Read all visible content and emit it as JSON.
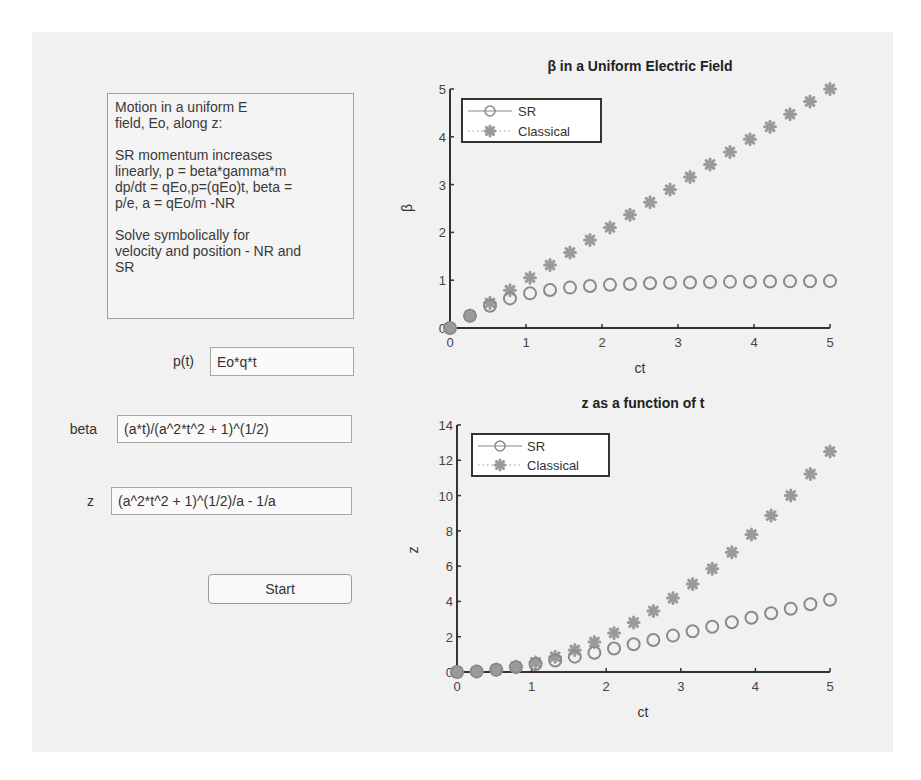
{
  "info_box": {
    "paragraphs": [
      "Motion in a uniform E\nfield, Eo, along z:",
      "SR momentum increases\nlinearly, p = beta*gamma*m\ndp/dt = qEo,p=(qEo)t, beta =\np/e,  a = qEo/m -NR",
      "Solve symbolically for\nvelocity and position - NR and\nSR"
    ]
  },
  "fields": {
    "p": {
      "label": "p(t)",
      "value": "Eo*q*t"
    },
    "beta": {
      "label": "beta",
      "value": "(a*t)/(a^2*t^2 + 1)^(1/2)"
    },
    "z": {
      "label": "z",
      "value": "(a^2*t^2 + 1)^(1/2)/a - 1/a"
    }
  },
  "start_button": {
    "label": "Start"
  },
  "colors": {
    "figure_bg": "#f1f1f1",
    "marker": "#8a8a8a",
    "axis": "#333333"
  },
  "chart_data": [
    {
      "type": "scatter",
      "title": "β in a Uniform Electric Field",
      "xlabel": "ct",
      "ylabel": "β",
      "xlim": [
        0,
        5
      ],
      "ylim": [
        0,
        5
      ],
      "xticks": [
        "0",
        "1",
        "2",
        "3",
        "4",
        "5"
      ],
      "yticks": [
        "0",
        "1",
        "2",
        "3",
        "4",
        "5"
      ],
      "grid": false,
      "legend_position": "upper left",
      "x": [
        0,
        0.263,
        0.526,
        0.789,
        1.053,
        1.316,
        1.579,
        1.842,
        2.105,
        2.368,
        2.632,
        2.895,
        3.158,
        3.421,
        3.684,
        3.947,
        4.211,
        4.474,
        4.737,
        5.0
      ],
      "series": [
        {
          "name": "SR",
          "marker": "open-circle",
          "line": "solid",
          "values": [
            0,
            0.254,
            0.466,
            0.619,
            0.725,
            0.796,
            0.845,
            0.879,
            0.903,
            0.921,
            0.935,
            0.945,
            0.953,
            0.96,
            0.965,
            0.969,
            0.973,
            0.976,
            0.978,
            0.981
          ]
        },
        {
          "name": "Classical",
          "marker": "asterisk",
          "line": "dotted",
          "values": [
            0,
            0.263,
            0.526,
            0.789,
            1.053,
            1.316,
            1.579,
            1.842,
            2.105,
            2.368,
            2.632,
            2.895,
            3.158,
            3.421,
            3.684,
            3.947,
            4.211,
            4.474,
            4.737,
            5.0
          ]
        }
      ]
    },
    {
      "type": "scatter",
      "title": "z as a function of t",
      "xlabel": "ct",
      "ylabel": "z",
      "xlim": [
        0,
        5
      ],
      "ylim": [
        0,
        14
      ],
      "xticks": [
        "0",
        "1",
        "2",
        "3",
        "4",
        "5"
      ],
      "yticks": [
        "0",
        "2",
        "4",
        "6",
        "8",
        "10",
        "12",
        "14"
      ],
      "grid": false,
      "legend_position": "upper left",
      "x": [
        0,
        0.263,
        0.526,
        0.789,
        1.053,
        1.316,
        1.579,
        1.842,
        2.105,
        2.368,
        2.632,
        2.895,
        3.158,
        3.421,
        3.684,
        3.947,
        4.211,
        4.474,
        4.737,
        5.0
      ],
      "series": [
        {
          "name": "SR",
          "marker": "open-circle",
          "line": "solid",
          "values": [
            0,
            0.034,
            0.13,
            0.275,
            0.452,
            0.653,
            0.869,
            1.095,
            1.331,
            1.571,
            1.815,
            2.063,
            2.312,
            2.564,
            2.817,
            3.072,
            3.328,
            3.584,
            3.841,
            4.099
          ]
        },
        {
          "name": "Classical",
          "marker": "asterisk",
          "line": "dotted",
          "values": [
            0,
            0.035,
            0.139,
            0.312,
            0.554,
            0.866,
            1.247,
            1.697,
            2.216,
            2.805,
            3.463,
            4.19,
            4.986,
            5.852,
            6.787,
            7.791,
            8.864,
            10.007,
            11.219,
            12.5
          ]
        }
      ]
    }
  ]
}
